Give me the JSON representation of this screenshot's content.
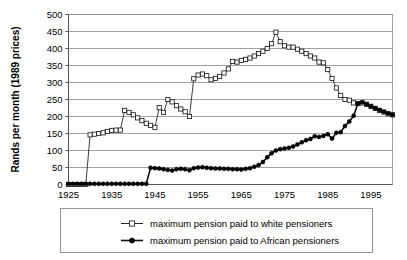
{
  "chart_data": {
    "type": "line",
    "title": "",
    "xlabel": "",
    "ylabel": "Rands per month (1989 prices)",
    "xlim": [
      1925,
      2000
    ],
    "ylim": [
      0,
      500
    ],
    "grid": true,
    "legend_position": "bottom",
    "x_ticks": [
      "1925",
      "1935",
      "1945",
      "1955",
      "1965",
      "1975",
      "1985",
      "1995"
    ],
    "x_tick_values": [
      1925,
      1935,
      1945,
      1955,
      1965,
      1975,
      1985,
      1995
    ],
    "y_ticks": [
      "0",
      "50",
      "100",
      "150",
      "200",
      "250",
      "300",
      "350",
      "400",
      "450",
      "500"
    ],
    "y_tick_values": [
      0,
      50,
      100,
      150,
      200,
      250,
      300,
      350,
      400,
      450,
      500
    ],
    "series": [
      {
        "name": "maximum pension paid to white pensioners",
        "marker": "open-square",
        "color": "#111111",
        "x": [
          1925,
          1926,
          1927,
          1928,
          1929,
          1930,
          1931,
          1932,
          1933,
          1934,
          1935,
          1936,
          1937,
          1938,
          1939,
          1940,
          1941,
          1942,
          1943,
          1944,
          1945,
          1946,
          1947,
          1948,
          1949,
          1950,
          1951,
          1952,
          1953,
          1954,
          1955,
          1956,
          1957,
          1958,
          1959,
          1960,
          1961,
          1962,
          1963,
          1964,
          1965,
          1966,
          1967,
          1968,
          1969,
          1970,
          1971,
          1972,
          1973,
          1974,
          1975,
          1976,
          1977,
          1978,
          1979,
          1980,
          1981,
          1982,
          1983,
          1984,
          1985,
          1986,
          1987,
          1988,
          1989,
          1990,
          1991,
          1992,
          1993,
          1994,
          1995,
          1996,
          1997,
          1998,
          1999,
          2000
        ],
        "y": [
          0,
          0,
          0,
          0,
          0,
          146,
          148,
          150,
          152,
          156,
          159,
          160,
          160,
          218,
          212,
          205,
          196,
          188,
          180,
          174,
          168,
          226,
          212,
          250,
          243,
          232,
          222,
          214,
          200,
          311,
          322,
          325,
          320,
          308,
          312,
          318,
          328,
          340,
          362,
          360,
          365,
          368,
          372,
          378,
          385,
          392,
          400,
          414,
          448,
          420,
          408,
          404,
          404,
          398,
          392,
          385,
          378,
          372,
          360,
          358,
          338,
          312,
          284,
          262,
          250,
          248,
          240,
          238,
          240,
          236,
          230,
          224,
          218,
          213,
          208,
          205
        ]
      },
      {
        "name": "maximum pension paid to African pensioners",
        "marker": "filled-circle",
        "color": "#000000",
        "x": [
          1925,
          1926,
          1927,
          1928,
          1929,
          1930,
          1931,
          1932,
          1933,
          1934,
          1935,
          1936,
          1937,
          1938,
          1939,
          1940,
          1941,
          1942,
          1943,
          1944,
          1945,
          1946,
          1947,
          1948,
          1949,
          1950,
          1951,
          1952,
          1953,
          1954,
          1955,
          1956,
          1957,
          1958,
          1959,
          1960,
          1961,
          1962,
          1963,
          1964,
          1965,
          1966,
          1967,
          1968,
          1969,
          1970,
          1971,
          1972,
          1973,
          1974,
          1975,
          1976,
          1977,
          1978,
          1979,
          1980,
          1981,
          1982,
          1983,
          1984,
          1985,
          1986,
          1987,
          1988,
          1989,
          1990,
          1991,
          1992,
          1993,
          1994,
          1995,
          1996,
          1997,
          1998,
          1999,
          2000
        ],
        "y": [
          2,
          2,
          2,
          2,
          2,
          2,
          2,
          2,
          2,
          2,
          2,
          2,
          2,
          2,
          2,
          2,
          2,
          2,
          2,
          49,
          48,
          47,
          45,
          43,
          41,
          45,
          46,
          45,
          42,
          48,
          50,
          51,
          49,
          48,
          47,
          47,
          46,
          46,
          45,
          45,
          44,
          46,
          48,
          52,
          57,
          66,
          80,
          92,
          100,
          104,
          106,
          108,
          112,
          118,
          124,
          130,
          134,
          142,
          140,
          143,
          148,
          135,
          152,
          154,
          172,
          185,
          202,
          238,
          242,
          236,
          230,
          224,
          219,
          214,
          209,
          205
        ]
      }
    ]
  },
  "legend": {
    "entries": [
      {
        "label": "maximum pension paid to white pensioners",
        "marker": "open-square"
      },
      {
        "label": "maximum pension paid to African pensioners",
        "marker": "filled-circle"
      }
    ]
  }
}
